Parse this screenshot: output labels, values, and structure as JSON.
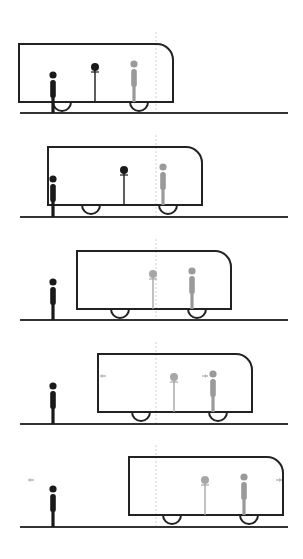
{
  "diagram": {
    "colors": {
      "outline": "#222222",
      "ground": "#333333",
      "observer_platform": "#1a1a1a",
      "observer_train": "#9a9a9a",
      "dotted_line": "#d0d0d0",
      "signal": "#bbbbbb"
    },
    "dotted_line_x": 156,
    "ground": {
      "x1": 20,
      "x2": 288
    },
    "train": {
      "width": 154,
      "height": 58,
      "corner_radius": 16,
      "wheel_offsets": [
        43,
        120
      ],
      "wheel_radius": 9,
      "clock_offset": 76,
      "passenger_offset": 115
    },
    "platform_observer_x": 53,
    "panels": [
      {
        "id": 1,
        "train_left": 19,
        "train_top": 44,
        "ground_y": 113,
        "clock_color": "#1a1a1a",
        "clock_style": "dark",
        "signals": []
      },
      {
        "id": 2,
        "train_left": 48,
        "train_top": 147,
        "ground_y": 217,
        "clock_color": "#1a1a1a",
        "clock_style": "dark",
        "signals": []
      },
      {
        "id": 3,
        "train_left": 77,
        "train_top": 251,
        "ground_y": 320,
        "clock_color": "#a6a6a6",
        "clock_style": "light",
        "signals": []
      },
      {
        "id": 4,
        "train_left": 98,
        "train_top": 354,
        "ground_y": 424,
        "clock_color": "#a6a6a6",
        "clock_style": "light",
        "signals": [
          {
            "x": 103,
            "y": 376,
            "dir": "left"
          },
          {
            "x": 205,
            "y": 376,
            "dir": "right"
          }
        ]
      },
      {
        "id": 5,
        "train_left": 129,
        "train_top": 457,
        "ground_y": 527,
        "clock_color": "#a6a6a6",
        "clock_style": "light",
        "signals": [
          {
            "x": 31,
            "y": 480,
            "dir": "left"
          },
          {
            "x": 279,
            "y": 480,
            "dir": "right"
          }
        ]
      }
    ]
  }
}
